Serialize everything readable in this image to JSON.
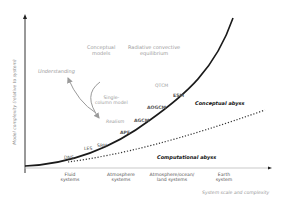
{
  "axes": {
    "y_label": "Model complexity (relative to system)",
    "x_label": "System scale and complexity"
  },
  "x_categories": [
    {
      "label_line1": "Fluid",
      "label_line2": "systems"
    },
    {
      "label_line1": "Atmosphere",
      "label_line2": "systems"
    },
    {
      "label_line1": "Atmosphere/ocean/",
      "label_line2": "land systems"
    },
    {
      "label_line1": "Earth",
      "label_line2": "system"
    }
  ],
  "concept_labels": {
    "conceptual_models_line1": "Conceptual",
    "conceptual_models_line2": "models",
    "radiative_line1": "Radiative convective",
    "radiative_line2": "equilibrium",
    "understanding": "Understanding",
    "single_column_line1": "Single-",
    "single_column_line2": "column model",
    "realism": "Realism",
    "qtcm": "QTCM"
  },
  "model_labels": {
    "dns": "DNS",
    "les": "LES",
    "srm": "SRM",
    "ape": "APE",
    "agcm": "AGCM",
    "aogcm": "AOGCM",
    "esm": "ESM"
  },
  "curves": {
    "conceptual_abyss": "Conceptual abyss",
    "computational_abyss": "Computational abyss"
  },
  "colors": {
    "axis": "#222222",
    "solid_curve": "#1a1a1a",
    "dotted_curve": "#333333",
    "arrow": "#9a9a9a"
  }
}
